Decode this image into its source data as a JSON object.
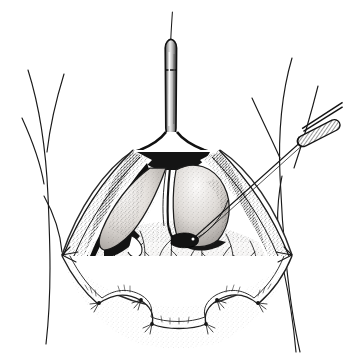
{
  "figure": {
    "kind": "surgical-line-illustration",
    "title": "Open surgical exposure with retracted wound edges",
    "style": "pen-and-ink stipple line drawing, monochrome",
    "background_color": "#ffffff",
    "ink_color": "#1a1a1a",
    "canvas": {
      "width": 354,
      "height": 364
    }
  },
  "palette": {
    "ink": "#1a1a1a",
    "line_mid": "#3a3a3a",
    "line_light": "#6b6b6b",
    "paper": "#ffffff",
    "tissue_light": "#f2f0ee",
    "tissue_mid": "#d9d5d1",
    "tissue_dark": "#8d8884",
    "shadow_deep": "#111111",
    "metal_light": "#e8e8e8",
    "metal_mid": "#a8a8a8",
    "metal_dark": "#4a4a4a"
  },
  "elements": {
    "body_outline": {
      "name": "patient-torso-contour",
      "description": "Soft freehand contour lines of the patient's flanks and hips framing the operative field on the left and right",
      "visible_lines": 5
    },
    "cannula": {
      "name": "vertical-cannula-instrument",
      "description": "Cylindrical tubular instrument entering the superior apex of the wound, shaded with a metallic gradient and divided into two segments",
      "orientation": "vertical",
      "top_y": 40,
      "bottom_y": 140,
      "center_x": 170
    },
    "guidewire": {
      "name": "guidewire-stylet",
      "description": "Very fine wire projecting upward out of the top of the cannula",
      "top_y": 12,
      "bottom_y": 44
    },
    "needle_handle": {
      "name": "needle-holder-handle",
      "description": "Hatched elongated instrument handle at upper right, angled down-left",
      "angle_degrees": -27
    },
    "needle_shaft": {
      "name": "needle-shaft",
      "description": "Long straight thin shaft running from the upper-right handle diagonally down-left to a small dark target inside the wound"
    },
    "needle_tip_target": {
      "name": "needle-tip-target-structure",
      "description": "Small dark cylindrical structure (duct or vessel stump) at the needle tip in the centre of the field"
    },
    "wound": {
      "name": "retracted-wound-cavity",
      "description": "Diamond / lens shaped open wound with sharply tented lateral corners and a scalloped inferior margin held open by stay sutures"
    },
    "wound_edge_left": {
      "name": "wound-edge-left",
      "description": "Heavily stippled everted cut edge of the left wound wall with deep shadow beneath"
    },
    "wound_edge_right": {
      "name": "wound-edge-right",
      "description": "Stippled everted cut edge of the right wound wall"
    },
    "muscle_flap_left": {
      "name": "retracted-muscle-flap-left",
      "description": "Tongue-shaped pale muscle belly retracted to the left of the midline, rounded and gradient shaded"
    },
    "muscle_flap_right": {
      "name": "retracted-muscle-flap-right",
      "description": "Dome shaped pale muscle mass retracted to the right of the midline"
    },
    "midline_raphe": {
      "name": "midline-raphe",
      "description": "Dark vertical cleft separating the two retracted muscle bellies"
    },
    "deep_tissue_floor": {
      "name": "deep-tissue-floor",
      "description": "Broad finely stippled floor of the wound showing branching subserosal vessels"
    },
    "vessels": {
      "name": "branching-vessels",
      "description": "Fine arborising vessel lines spreading over the wound floor",
      "approx_count": 14
    },
    "sutures": {
      "name": "stay-sutures",
      "description": "Small tied stay sutures with protruding cut ends anchoring the retracted skin margins",
      "count": 6,
      "positions": [
        "inferior-left",
        "inferior-left-mid",
        "inferior-mid-left",
        "inferior-mid-right",
        "inferior-right-mid",
        "inferior-right"
      ]
    },
    "skin_flap_inferior": {
      "name": "inferior-skin-flap",
      "description": "Scalloped inferior skin and subcutaneous flap folded downward and held by the stay sutures"
    }
  },
  "annotations": {
    "labels": [],
    "leader_lines": [],
    "caption": ""
  }
}
